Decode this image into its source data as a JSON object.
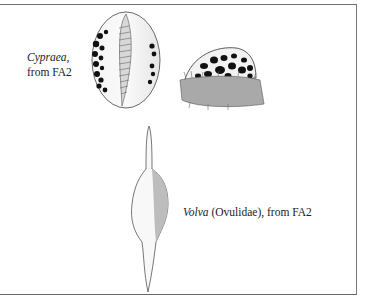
{
  "figure": {
    "captions": [
      {
        "italic": "Cypraea",
        "rest": ", from FA2"
      },
      {
        "italic": "Volva",
        "rest": " (Ovulidae), from FA2"
      }
    ],
    "illustrations": [
      {
        "name": "cypraea-ventral-view"
      },
      {
        "name": "cypraea-living-animal-lateral-view"
      },
      {
        "name": "volva-shell"
      }
    ],
    "colors": {
      "border": "#6f6f6f",
      "ink": "#222222",
      "background": "#ffffff"
    }
  }
}
